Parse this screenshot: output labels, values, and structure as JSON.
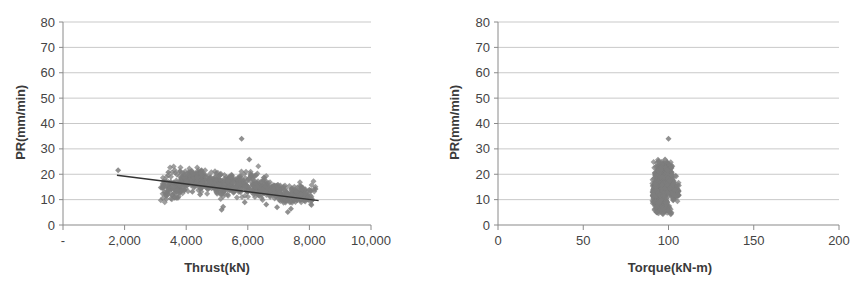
{
  "figure": {
    "background": "#ffffff",
    "marker_color": "#7d7d7d",
    "gridline_color": "#c9c9c9",
    "axis_color": "#8a8a8a",
    "trendline_color": "#333333",
    "text_color": "#3a3a3a"
  },
  "chart_data": [
    {
      "type": "scatter",
      "id": "thrust-vs-pr",
      "title": "",
      "xlabel": "Thrust(kN)",
      "ylabel": "PR(mm/min)",
      "xlim": [
        0,
        10000
      ],
      "ylim": [
        0,
        80
      ],
      "xticks": [
        0,
        2000,
        4000,
        6000,
        8000,
        10000
      ],
      "xticklabels": [
        "-",
        "2,000",
        "4,000",
        "6,000",
        "8,000",
        "10,000"
      ],
      "yticks": [
        0,
        10,
        20,
        30,
        40,
        50,
        60,
        70,
        80
      ],
      "yticklabels": [
        "0",
        "10",
        "20",
        "30",
        "40",
        "50",
        "60",
        "70",
        "80"
      ],
      "grid": "horizontal",
      "legend": "none",
      "marker": "diamond",
      "marker_size": 3,
      "trendline": {
        "visible": true,
        "x0": 1750,
        "y0": 19.6,
        "x1": 8300,
        "y1": 9.6
      },
      "notes": "Dense cloud of ~900 points, Thrust 3200-7900 kN, PR mostly 8-20 mm/min, decreasing trend. Outliers near (5800, 34), (6050, 26), (1800, 21.5).",
      "points": [
        [
          1790,
          21.6
        ],
        [
          3420,
          20.8
        ],
        [
          3500,
          17.0
        ],
        [
          3280,
          16.2
        ],
        [
          3300,
          12.8
        ],
        [
          3350,
          11.4
        ],
        [
          3400,
          13.5
        ],
        [
          3450,
          15.1
        ],
        [
          3520,
          14.2
        ],
        [
          3560,
          11.8
        ],
        [
          3600,
          12.5
        ],
        [
          3650,
          13.9
        ],
        [
          3700,
          15.4
        ],
        [
          3750,
          14.6
        ],
        [
          3800,
          16.5
        ],
        [
          3850,
          18.0
        ],
        [
          3900,
          17.2
        ],
        [
          3950,
          15.8
        ],
        [
          4000,
          16.9
        ],
        [
          4050,
          19.2
        ],
        [
          4100,
          20.1
        ],
        [
          4150,
          18.6
        ],
        [
          4200,
          17.4
        ],
        [
          4250,
          19.8
        ],
        [
          4300,
          20.4
        ],
        [
          4350,
          18.9
        ],
        [
          4400,
          17.1
        ],
        [
          4450,
          16.2
        ],
        [
          4500,
          18.3
        ],
        [
          4550,
          19.4
        ],
        [
          4600,
          17.8
        ],
        [
          4650,
          16.6
        ],
        [
          4700,
          15.9
        ],
        [
          4750,
          17.3
        ],
        [
          4800,
          18.7
        ],
        [
          4850,
          16.1
        ],
        [
          4900,
          14.8
        ],
        [
          4950,
          15.5
        ],
        [
          5000,
          17.0
        ],
        [
          5050,
          18.2
        ],
        [
          5100,
          16.4
        ],
        [
          5150,
          14.2
        ],
        [
          5200,
          13.0
        ],
        [
          5250,
          15.1
        ],
        [
          5300,
          16.8
        ],
        [
          5350,
          18.1
        ],
        [
          5400,
          17.5
        ],
        [
          5450,
          16.0
        ],
        [
          5500,
          14.6
        ],
        [
          5550,
          13.4
        ],
        [
          5600,
          15.2
        ],
        [
          5650,
          16.7
        ],
        [
          5700,
          18.4
        ],
        [
          5750,
          19.0
        ],
        [
          5800,
          34.0
        ],
        [
          5850,
          17.2
        ],
        [
          5900,
          15.6
        ],
        [
          5950,
          14.0
        ],
        [
          6000,
          13.2
        ],
        [
          6050,
          25.8
        ],
        [
          6100,
          19.6
        ],
        [
          6150,
          18.0
        ],
        [
          6200,
          16.3
        ],
        [
          6250,
          14.9
        ],
        [
          6300,
          13.6
        ],
        [
          6350,
          12.4
        ],
        [
          6400,
          14.1
        ],
        [
          6450,
          15.7
        ],
        [
          6500,
          17.4
        ],
        [
          6550,
          16.2
        ],
        [
          6600,
          14.5
        ],
        [
          6650,
          13.1
        ],
        [
          6700,
          12.2
        ],
        [
          6750,
          13.8
        ],
        [
          6800,
          15.0
        ],
        [
          6850,
          14.3
        ],
        [
          6900,
          12.9
        ],
        [
          6950,
          11.7
        ],
        [
          7000,
          12.6
        ],
        [
          7050,
          13.9
        ],
        [
          7100,
          12.1
        ],
        [
          7150,
          11.0
        ],
        [
          7200,
          11.9
        ],
        [
          7250,
          13.2
        ],
        [
          7300,
          12.0
        ],
        [
          7350,
          10.8
        ],
        [
          7400,
          11.5
        ],
        [
          7450,
          12.8
        ],
        [
          7500,
          11.2
        ],
        [
          7550,
          10.1
        ],
        [
          7600,
          10.9
        ],
        [
          7650,
          12.3
        ],
        [
          7700,
          13.6
        ],
        [
          7750,
          14.8
        ],
        [
          7800,
          11.4
        ],
        [
          7850,
          9.8
        ],
        [
          7900,
          10.6
        ],
        [
          7950,
          12.0
        ],
        [
          8050,
          13.4
        ],
        [
          8200,
          14.2
        ],
        [
          5150,
          6.0
        ],
        [
          5200,
          7.2
        ],
        [
          7300,
          5.1
        ],
        [
          7400,
          6.4
        ],
        [
          6950,
          7.0
        ],
        [
          6600,
          8.1
        ],
        [
          5900,
          9.0
        ],
        [
          4450,
          12.0
        ],
        [
          4200,
          13.1
        ],
        [
          3950,
          13.8
        ]
      ]
    },
    {
      "type": "scatter",
      "id": "torque-vs-pr",
      "title": "",
      "xlabel": "Torque(kN-m)",
      "ylabel": "PR(mm/min)",
      "xlim": [
        0,
        200
      ],
      "ylim": [
        0,
        80
      ],
      "xticks": [
        0,
        50,
        100,
        150,
        200
      ],
      "xticklabels": [
        "0",
        "50",
        "100",
        "150",
        "200"
      ],
      "yticks": [
        0,
        10,
        20,
        30,
        40,
        50,
        60,
        70,
        80
      ],
      "yticklabels": [
        "0",
        "10",
        "20",
        "30",
        "40",
        "50",
        "60",
        "70",
        "80"
      ],
      "grid": "horizontal",
      "legend": "none",
      "marker": "diamond",
      "marker_size": 3,
      "trendline": {
        "visible": false
      },
      "notes": "Tight vertical cluster of ~900 points at Torque 91-106 kN-m, PR 5-26 mm/min, one outlier at (100, 34).",
      "points": [
        [
          100,
          34.0
        ],
        [
          98,
          25.8
        ],
        [
          97,
          24.2
        ],
        [
          99,
          23.0
        ],
        [
          96,
          22.4
        ],
        [
          98,
          21.6
        ],
        [
          95,
          21.0
        ],
        [
          97,
          20.4
        ],
        [
          99,
          20.0
        ],
        [
          94,
          19.6
        ],
        [
          96,
          19.2
        ],
        [
          98,
          18.8
        ],
        [
          100,
          18.4
        ],
        [
          95,
          18.0
        ],
        [
          97,
          17.6
        ],
        [
          93,
          17.2
        ],
        [
          99,
          16.8
        ],
        [
          96,
          16.4
        ],
        [
          94,
          16.0
        ],
        [
          98,
          15.6
        ],
        [
          92,
          15.2
        ],
        [
          95,
          14.8
        ],
        [
          97,
          14.4
        ],
        [
          99,
          14.0
        ],
        [
          93,
          13.6
        ],
        [
          96,
          13.2
        ],
        [
          94,
          12.8
        ],
        [
          98,
          12.4
        ],
        [
          92,
          12.0
        ],
        [
          95,
          11.6
        ],
        [
          97,
          11.2
        ],
        [
          93,
          10.8
        ],
        [
          96,
          10.4
        ],
        [
          94,
          10.0
        ],
        [
          98,
          9.6
        ],
        [
          92,
          9.2
        ],
        [
          95,
          8.8
        ],
        [
          97,
          8.4
        ],
        [
          93,
          8.0
        ],
        [
          96,
          7.6
        ],
        [
          99,
          7.2
        ],
        [
          94,
          6.8
        ],
        [
          97,
          6.4
        ],
        [
          98,
          6.0
        ],
        [
          100,
          5.4
        ],
        [
          104,
          12.6
        ],
        [
          105,
          12.0
        ],
        [
          103,
          13.4
        ],
        [
          106,
          11.8
        ],
        [
          102,
          14.6
        ],
        [
          101,
          15.8
        ],
        [
          103,
          16.2
        ],
        [
          102,
          17.0
        ],
        [
          101,
          18.2
        ],
        [
          100,
          19.0
        ],
        [
          91,
          13.0
        ],
        [
          91,
          11.5
        ],
        [
          92,
          14.5
        ],
        [
          93,
          19.8
        ],
        [
          94,
          21.5
        ],
        [
          95,
          23.4
        ],
        [
          96,
          24.8
        ],
        [
          99,
          22.0
        ],
        [
          100,
          21.2
        ],
        [
          101,
          20.2
        ]
      ]
    }
  ]
}
